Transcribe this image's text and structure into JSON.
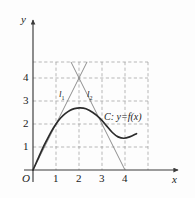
{
  "figure": {
    "axes": {
      "x_axis_label": "x",
      "y_axis_label": "y",
      "origin_label": "O",
      "x_ticks": [
        "1",
        "2",
        "3",
        "4"
      ],
      "y_ticks": [
        "1",
        "2",
        "3",
        "4"
      ]
    },
    "annotations": {
      "line1_label": "l",
      "line1_sub": "1",
      "line2_label": "l",
      "line2_sub": "2",
      "curve_label": "C: y=f(x)"
    },
    "colors": {
      "curve": "#2b2b2b",
      "line": "#6b6b6b",
      "grid": "#9a9a9a",
      "axis": "#3a3a3a",
      "text": "#1a1a1a"
    }
  },
  "chart_data": {
    "type": "line",
    "title": "",
    "xlabel": "x",
    "ylabel": "y",
    "xlim": [
      -0.35,
      6.4
    ],
    "ylim": [
      -0.55,
      5.3
    ],
    "grid": true,
    "grid_style": "dashed",
    "grid_x": [
      1,
      2,
      3,
      4,
      5
    ],
    "grid_y": [
      1,
      2,
      3,
      4,
      4.7
    ],
    "xticks": [
      1,
      2,
      3,
      4
    ],
    "yticks": [
      1,
      2,
      3,
      4
    ],
    "legend": "none",
    "series": [
      {
        "name": "C: y=f(x)",
        "type": "curve",
        "points": [
          [
            0.0,
            0.0
          ],
          [
            0.2,
            0.45
          ],
          [
            0.4,
            0.9
          ],
          [
            0.6,
            1.3
          ],
          [
            0.8,
            1.68
          ],
          [
            1.0,
            2.0
          ],
          [
            1.2,
            2.26
          ],
          [
            1.4,
            2.45
          ],
          [
            1.6,
            2.59
          ],
          [
            1.8,
            2.67
          ],
          [
            2.05,
            2.7
          ],
          [
            2.3,
            2.66
          ],
          [
            2.6,
            2.5
          ],
          [
            2.9,
            2.26
          ],
          [
            3.2,
            1.92
          ],
          [
            3.45,
            1.63
          ],
          [
            3.7,
            1.44
          ],
          [
            3.95,
            1.38
          ],
          [
            4.2,
            1.44
          ],
          [
            4.5,
            1.58
          ]
        ]
      },
      {
        "name": "l1",
        "type": "line",
        "slope": 2,
        "intercept": 0,
        "points": [
          [
            0.0,
            0.0
          ],
          [
            2.0,
            4.0
          ],
          [
            2.35,
            4.7
          ]
        ]
      },
      {
        "name": "l2",
        "type": "line",
        "slope": -2,
        "intercept": 8,
        "points": [
          [
            1.65,
            4.7
          ],
          [
            2.0,
            4.0
          ],
          [
            4.0,
            0.0
          ]
        ]
      }
    ],
    "annotations": [
      {
        "text": "l1",
        "x": 1.2,
        "y": 3.3
      },
      {
        "text": "l2",
        "x": 2.4,
        "y": 3.3
      },
      {
        "text": "C: y=f(x)",
        "x": 3.15,
        "y": 2.3
      }
    ],
    "intersection_point": [
      2,
      4
    ],
    "tangency_points": [
      [
        1,
        2
      ],
      [
        3,
        2
      ]
    ]
  }
}
